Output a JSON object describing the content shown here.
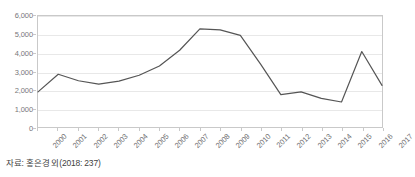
{
  "chart_data": {
    "type": "line",
    "title": "",
    "subtitle": "",
    "xlabel": "",
    "ylabel": "",
    "categories": [
      "2000",
      "2001",
      "2002",
      "2003",
      "2004",
      "2005",
      "2006",
      "2007",
      "2008",
      "2009",
      "2010",
      "2011",
      "2012",
      "2013",
      "2014",
      "2015",
      "2016",
      "2017"
    ],
    "series": [
      {
        "name": "series-1",
        "color": "#555555",
        "values": [
          1900,
          2850,
          2500,
          2320,
          2480,
          2800,
          3300,
          4150,
          5300,
          5250,
          4950,
          3400,
          1750,
          1900,
          1550,
          1350,
          4080,
          2250
        ]
      }
    ],
    "ylim": [
      0,
      6000
    ],
    "y_ticks": [
      0,
      1000,
      2000,
      3000,
      4000,
      5000,
      6000
    ],
    "y_tick_labels": [
      "0",
      "1,000",
      "2,000",
      "3,000",
      "4,000",
      "5,000",
      "6,000"
    ],
    "grid": true,
    "grid_color": "#e8e8e8",
    "legend": false,
    "legend_position": "none",
    "markers": false,
    "frame_color": "#c9c9c9"
  },
  "figure": {
    "title_truncated": "",
    "source_note": "자료: 홍은경 외(2018: 237)",
    "background_color": "#ffffff",
    "text_color": "#4a4a4a"
  }
}
